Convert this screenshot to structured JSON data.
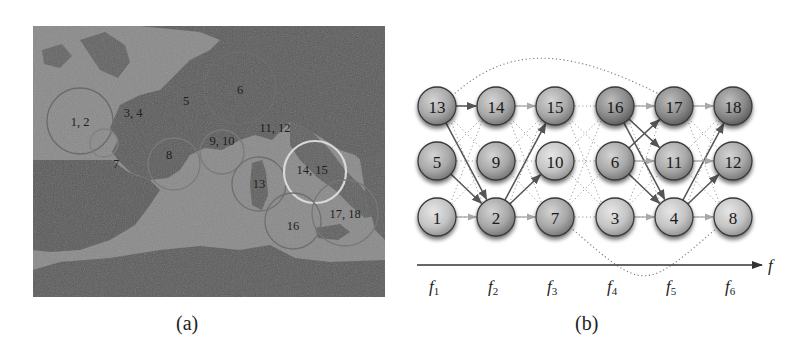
{
  "figure": {
    "panel_a": {
      "caption": "(a)",
      "description": "Map of western Europe / Mediterranean with numbered observation regions",
      "region_labels": [
        {
          "text": "1, 2",
          "x": 80,
          "y": 122
        },
        {
          "text": "3, 4",
          "x": 133,
          "y": 113
        },
        {
          "text": "5",
          "x": 186,
          "y": 101
        },
        {
          "text": "6",
          "x": 240,
          "y": 90
        },
        {
          "text": "7",
          "x": 116,
          "y": 164
        },
        {
          "text": "8",
          "x": 169,
          "y": 155
        },
        {
          "text": "9, 10",
          "x": 222,
          "y": 141
        },
        {
          "text": "11, 12",
          "x": 275,
          "y": 128
        },
        {
          "text": "13",
          "x": 259,
          "y": 184
        },
        {
          "text": "14, 15",
          "x": 312,
          "y": 170
        },
        {
          "text": "16",
          "x": 293,
          "y": 226
        },
        {
          "text": "17, 18",
          "x": 345,
          "y": 214
        }
      ],
      "circles": [
        {
          "cx": 80,
          "cy": 121,
          "r": 33,
          "color": "#6a6a6a"
        },
        {
          "cx": 104,
          "cy": 143,
          "r": 14,
          "color": "#808080"
        },
        {
          "cx": 174,
          "cy": 164,
          "r": 26,
          "color": "#7a7a7a"
        },
        {
          "cx": 222,
          "cy": 152,
          "r": 22,
          "color": "#7a7a7a"
        },
        {
          "cx": 259,
          "cy": 184,
          "r": 27,
          "color": "#6f6f6f"
        },
        {
          "cx": 240,
          "cy": 88,
          "r": 36,
          "color": "#6e6e6e"
        },
        {
          "cx": 315,
          "cy": 172,
          "r": 31,
          "color": "#d9d9d9"
        },
        {
          "cx": 293,
          "cy": 221,
          "r": 28,
          "color": "#6f6f6f"
        },
        {
          "cx": 345,
          "cy": 213,
          "r": 33,
          "color": "#777777"
        }
      ]
    },
    "panel_b": {
      "caption": "(b)",
      "axis_label": "f",
      "feature_labels": [
        {
          "base": "f",
          "sub": "1"
        },
        {
          "base": "f",
          "sub": "2"
        },
        {
          "base": "f",
          "sub": "3"
        },
        {
          "base": "f",
          "sub": "4"
        },
        {
          "base": "f",
          "sub": "5"
        },
        {
          "base": "f",
          "sub": "6"
        }
      ],
      "columns_x": [
        437,
        496,
        555,
        615,
        674,
        733
      ],
      "rows_y": [
        106,
        161,
        217
      ],
      "nodes": [
        {
          "id": "13",
          "col": 0,
          "row": 0,
          "shade": "mid"
        },
        {
          "id": "5",
          "col": 0,
          "row": 1,
          "shade": "mid"
        },
        {
          "id": "1",
          "col": 0,
          "row": 2,
          "shade": "light"
        },
        {
          "id": "14",
          "col": 1,
          "row": 0,
          "shade": "mid"
        },
        {
          "id": "9",
          "col": 1,
          "row": 1,
          "shade": "mid"
        },
        {
          "id": "2",
          "col": 1,
          "row": 2,
          "shade": "mid"
        },
        {
          "id": "15",
          "col": 2,
          "row": 0,
          "shade": "mid"
        },
        {
          "id": "10",
          "col": 2,
          "row": 1,
          "shade": "light"
        },
        {
          "id": "7",
          "col": 2,
          "row": 2,
          "shade": "mid"
        },
        {
          "id": "16",
          "col": 3,
          "row": 0,
          "shade": "dark"
        },
        {
          "id": "6",
          "col": 3,
          "row": 1,
          "shade": "mid"
        },
        {
          "id": "3",
          "col": 3,
          "row": 2,
          "shade": "light"
        },
        {
          "id": "17",
          "col": 4,
          "row": 0,
          "shade": "dark"
        },
        {
          "id": "11",
          "col": 4,
          "row": 1,
          "shade": "mid"
        },
        {
          "id": "4",
          "col": 4,
          "row": 2,
          "shade": "light"
        },
        {
          "id": "18",
          "col": 5,
          "row": 0,
          "shade": "dark"
        },
        {
          "id": "12",
          "col": 5,
          "row": 1,
          "shade": "mid"
        },
        {
          "id": "8",
          "col": 5,
          "row": 2,
          "shade": "light"
        }
      ],
      "solid_edges": [
        {
          "from": "13",
          "to": "14",
          "weight": "strong"
        },
        {
          "from": "13",
          "to": "2",
          "weight": "strong"
        },
        {
          "from": "5",
          "to": "2",
          "weight": "strong"
        },
        {
          "from": "1",
          "to": "2",
          "weight": "faint"
        },
        {
          "from": "14",
          "to": "15",
          "weight": "faint"
        },
        {
          "from": "2",
          "to": "15",
          "weight": "strong"
        },
        {
          "from": "2",
          "to": "10",
          "weight": "strong"
        },
        {
          "from": "2",
          "to": "7",
          "weight": "faint"
        },
        {
          "from": "16",
          "to": "17",
          "weight": "faint"
        },
        {
          "from": "16",
          "to": "11",
          "weight": "strong"
        },
        {
          "from": "16",
          "to": "4",
          "weight": "strong"
        },
        {
          "from": "6",
          "to": "17",
          "weight": "strong"
        },
        {
          "from": "6",
          "to": "4",
          "weight": "strong"
        },
        {
          "from": "3",
          "to": "4",
          "weight": "faint"
        },
        {
          "from": "6",
          "to": "11",
          "weight": "faint"
        },
        {
          "from": "17",
          "to": "18",
          "weight": "faint"
        },
        {
          "from": "4",
          "to": "18",
          "weight": "strong"
        },
        {
          "from": "4",
          "to": "12",
          "weight": "strong"
        },
        {
          "from": "4",
          "to": "8",
          "weight": "faint"
        },
        {
          "from": "11",
          "to": "12",
          "weight": "faint"
        }
      ],
      "dotted_edges_note": "Dense dotted connections between all adjacent-column node pairs; long dotted arcs 13→17 (over top) and 7→8 (under bottom)"
    }
  },
  "colors": {
    "map_land_dark": "#5a5a5a",
    "map_sea_light": "#8c8c8c",
    "node_light": "#c9c9c9",
    "node_mid": "#a9a9a9",
    "node_dark": "#8a8a8a",
    "edge_strong": "#555555",
    "edge_faint": "#a8a8a8",
    "dotted": "#777777"
  }
}
